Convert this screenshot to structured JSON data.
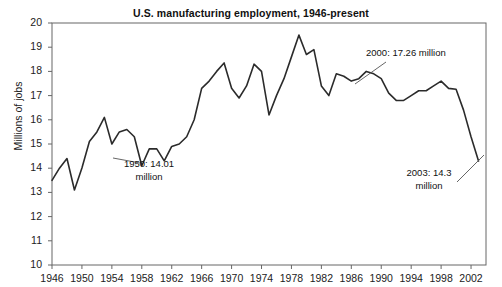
{
  "chart_data": {
    "type": "line",
    "title": "U.S. manufacturing employment, 1946-present",
    "xlabel": "",
    "ylabel": "Millions of jobs",
    "xlim": [
      1946,
      2004
    ],
    "ylim": [
      10,
      20
    ],
    "grid": false,
    "legend": "none",
    "xticks": [
      "1946",
      "1950",
      "1954",
      "1958",
      "1962",
      "1966",
      "1970",
      "1974",
      "1978",
      "1982",
      "1986",
      "1990",
      "1994",
      "1998",
      "2002"
    ],
    "yticks": [
      "10",
      "11",
      "12",
      "13",
      "14",
      "15",
      "16",
      "17",
      "18",
      "19",
      "20"
    ],
    "series": [
      {
        "name": "U.S. manufacturing employment",
        "x": [
          1946,
          1947,
          1948,
          1949,
          1950,
          1951,
          1952,
          1953,
          1954,
          1955,
          1956,
          1957,
          1958,
          1959,
          1960,
          1961,
          1962,
          1963,
          1964,
          1965,
          1966,
          1967,
          1968,
          1969,
          1970,
          1971,
          1972,
          1973,
          1974,
          1975,
          1976,
          1977,
          1978,
          1979,
          1980,
          1981,
          1982,
          1983,
          1984,
          1985,
          1986,
          1987,
          1988,
          1989,
          1990,
          1991,
          1992,
          1993,
          1994,
          1995,
          1996,
          1997,
          1998,
          1999,
          2000,
          2001,
          2002,
          2003
        ],
        "values": [
          13.5,
          14.0,
          14.4,
          13.1,
          14.01,
          15.1,
          15.5,
          16.1,
          15.0,
          15.5,
          15.6,
          15.3,
          14.1,
          14.8,
          14.8,
          14.3,
          14.9,
          15.0,
          15.3,
          16.0,
          17.3,
          17.6,
          18.0,
          18.35,
          17.3,
          16.9,
          17.4,
          18.3,
          18.0,
          16.2,
          17.0,
          17.7,
          18.6,
          19.5,
          18.7,
          18.9,
          17.4,
          17.0,
          17.9,
          17.8,
          17.6,
          17.7,
          18.0,
          17.9,
          17.7,
          17.1,
          16.8,
          16.8,
          17.0,
          17.2,
          17.2,
          17.4,
          17.6,
          17.3,
          17.26,
          16.4,
          15.3,
          14.3
        ]
      }
    ],
    "annotations": [
      {
        "name": "1950",
        "text": "1950: 14.01\nmillion",
        "point_x": 1950,
        "point_y": 14.01
      },
      {
        "name": "2000",
        "text": "2000: 17.26 million",
        "point_x": 2000,
        "point_y": 17.26
      },
      {
        "name": "2003",
        "text": "2003: 14.3\nmillion",
        "point_x": 2003,
        "point_y": 14.3
      }
    ],
    "line_color": "#2b2b2b",
    "axis_color": "#555555",
    "background": "#ffffff"
  }
}
